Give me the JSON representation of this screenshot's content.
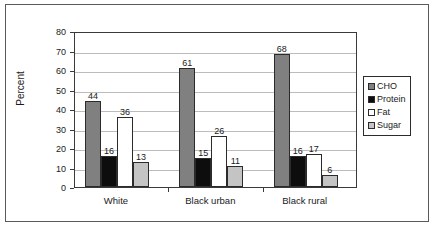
{
  "chart_data": {
    "type": "bar",
    "title": "",
    "xlabel": "",
    "ylabel": "Percent",
    "ylim": [
      0,
      80
    ],
    "yticks": [
      0,
      10,
      20,
      30,
      40,
      50,
      60,
      70,
      80
    ],
    "grid": true,
    "legend_position": "right",
    "categories": [
      "White",
      "Black urban",
      "Black rural"
    ],
    "series": [
      {
        "name": "CHO",
        "color": "#808080",
        "values": [
          44,
          61,
          68
        ]
      },
      {
        "name": "Protein",
        "color": "#0d0d0d",
        "values": [
          16,
          15,
          16
        ]
      },
      {
        "name": "Fat",
        "color": "#ffffff",
        "values": [
          36,
          26,
          17
        ]
      },
      {
        "name": "Sugar",
        "color": "#c4c4c4",
        "values": [
          13,
          11,
          6
        ]
      }
    ]
  },
  "axis": {
    "y_title": "Percent",
    "y_tick_labels": [
      "80",
      "70",
      "60",
      "50",
      "40",
      "30",
      "20",
      "10",
      "0"
    ],
    "x_tick_labels": [
      "White",
      "Black urban",
      "Black rural"
    ]
  },
  "legend": {
    "items": [
      {
        "label": "CHO",
        "color": "#808080"
      },
      {
        "label": "Protein",
        "color": "#0d0d0d"
      },
      {
        "label": "Fat",
        "color": "#ffffff"
      },
      {
        "label": "Sugar",
        "color": "#c4c4c4"
      }
    ]
  },
  "data_labels": {
    "white": [
      "44",
      "16",
      "36",
      "13"
    ],
    "black_urban": [
      "61",
      "15",
      "26",
      "11"
    ],
    "black_rural": [
      "68",
      "16",
      "17",
      "6"
    ]
  }
}
